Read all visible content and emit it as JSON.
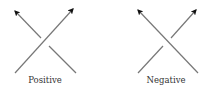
{
  "diagram": {
    "type": "knot-crossing-signs",
    "stroke_color": "#777777",
    "arrow_color": "#111111",
    "crossings": [
      {
        "label": "Positive",
        "over_strand": "bottom-left to top-right",
        "under_strand": "bottom-right to top-left",
        "arrows": [
          "top-left",
          "top-right"
        ]
      },
      {
        "label": "Negative",
        "over_strand": "bottom-right to top-left",
        "under_strand": "bottom-left to top-right",
        "arrows": [
          "top-left",
          "top-right"
        ]
      }
    ]
  }
}
